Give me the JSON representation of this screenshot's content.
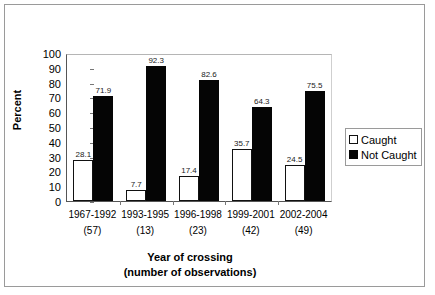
{
  "chart_data": {
    "type": "bar",
    "title": "",
    "xlabel": "Year of crossing",
    "xlabel_line2": "(number of observations)",
    "ylabel": "Percent",
    "ylim": [
      0,
      100
    ],
    "ytick_step": 10,
    "yticks": [
      "100",
      "90",
      "80",
      "70",
      "60",
      "50",
      "40",
      "30",
      "20",
      "10",
      "0"
    ],
    "grid": false,
    "legend_position": "right",
    "categories": [
      "1967-1992",
      "1993-1995",
      "1996-1998",
      "1999-2001",
      "2002-2004"
    ],
    "observations": [
      "(57)",
      "(13)",
      "(23)",
      "(42)",
      "(49)"
    ],
    "series": [
      {
        "name": "Caught",
        "color": "#ffffff",
        "values": [
          28.1,
          7.7,
          17.4,
          35.7,
          24.5
        ],
        "labels": [
          "28.1",
          "7.7",
          "17.4",
          "35.7",
          "24.5"
        ]
      },
      {
        "name": "Not Caught",
        "color": "#050505",
        "values": [
          71.9,
          92.3,
          82.6,
          64.3,
          75.5
        ],
        "labels": [
          "71.9",
          "92.3",
          "82.6",
          "64.3",
          "75.5"
        ]
      }
    ]
  },
  "legend": {
    "items": [
      {
        "label": "Caught",
        "swatch": "white-square-icon"
      },
      {
        "label": "Not Caught",
        "swatch": "black-square-icon"
      }
    ]
  }
}
